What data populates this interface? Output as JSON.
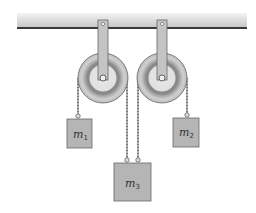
{
  "diagram": {
    "type": "physics-pulley-system",
    "colors": {
      "ceiling_light": "#f0f0f0",
      "ceiling_dark": "#c8c8c8",
      "ceiling_edge": "#3a3a3a",
      "pulley_outer": "#cfcfcf",
      "pulley_groove": "#8e8e8e",
      "pulley_inner": "#e2e2e2",
      "bracket": "#bdbdbd",
      "rope": "#9a9a9a",
      "mass_fill": "#b3b3b3",
      "mass_stroke": "#666666"
    },
    "masses": [
      {
        "id": "m1",
        "symbol": "m",
        "subscript": "1"
      },
      {
        "id": "m2",
        "symbol": "m",
        "subscript": "2"
      },
      {
        "id": "m3",
        "symbol": "m",
        "subscript": "3"
      }
    ],
    "pulleys": [
      {
        "id": "pulley-left"
      },
      {
        "id": "pulley-right"
      }
    ]
  }
}
